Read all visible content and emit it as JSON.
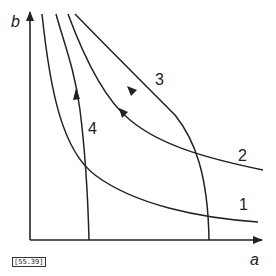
{
  "diagram": {
    "axes": {
      "x_label": "a",
      "y_label": "b"
    },
    "curves": [
      {
        "id": "1",
        "label": "1",
        "description": "hyperbola-like curve, lowest"
      },
      {
        "id": "2",
        "label": "2",
        "description": "hyperbola-like curve, with arrow pointing up-left"
      },
      {
        "id": "3",
        "label": "3",
        "description": "trajectory from a-axis upward, with arrow pointing up-left"
      },
      {
        "id": "4",
        "label": "4",
        "description": "near-vertical trajectory from a-axis upward, with arrow pointing up"
      }
    ],
    "figure_code": "[55.39]"
  },
  "colors": {
    "line": "#222222",
    "background": "#ffffff"
  }
}
